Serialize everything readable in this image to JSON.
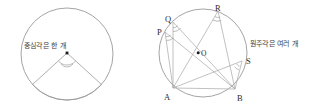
{
  "figure": {
    "background_color": "#ffffff",
    "stroke_color": "#9a9a9a",
    "label_color": "#2b2b2b",
    "width": 314,
    "height": 109
  },
  "left_panel": {
    "name": "central-angle-diagram",
    "caption": "중심각은 한 개",
    "circle": {
      "cx": 67,
      "cy": 54,
      "r": 46
    },
    "center_point": {
      "label": "",
      "x": 67,
      "y": 53
    },
    "angle_marks": 2,
    "rays": [
      {
        "from_x": 67,
        "from_y": 53,
        "to_x": 33,
        "to_y": 90
      },
      {
        "from_x": 67,
        "from_y": 53,
        "to_x": 101,
        "to_y": 90
      }
    ],
    "arc_endpoints": {
      "left_x": 33,
      "left_y": 90,
      "right_x": 101,
      "right_y": 90
    }
  },
  "right_panel": {
    "name": "inscribed-angle-diagram",
    "caption": "원주각은 여러 개",
    "circle": {
      "cx": 203,
      "cy": 53,
      "r": 44
    },
    "center_point": {
      "label": "O",
      "x": 199,
      "y": 53
    },
    "points": [
      {
        "label": "P",
        "x": 165,
        "y": 32,
        "label_x": 157,
        "label_y": 32
      },
      {
        "label": "Q",
        "x": 173,
        "y": 22,
        "label_x": 166,
        "label_y": 19
      },
      {
        "label": "R",
        "x": 218,
        "y": 11,
        "label_x": 217,
        "label_y": 8
      },
      {
        "label": "S",
        "x": 242,
        "y": 61,
        "label_x": 247,
        "label_y": 62
      },
      {
        "label": "A",
        "x": 173,
        "y": 88,
        "label_x": 166,
        "label_y": 96
      },
      {
        "label": "B",
        "x": 235,
        "y": 89,
        "label_x": 239,
        "label_y": 96
      }
    ],
    "chords": [
      {
        "from": "P",
        "to": "A"
      },
      {
        "from": "P",
        "to": "B"
      },
      {
        "from": "Q",
        "to": "A"
      },
      {
        "from": "Q",
        "to": "B"
      },
      {
        "from": "R",
        "to": "A"
      },
      {
        "from": "R",
        "to": "B"
      },
      {
        "from": "S",
        "to": "A"
      },
      {
        "from": "S",
        "to": "B"
      },
      {
        "from": "A",
        "to": "B"
      }
    ],
    "angle_vertices": [
      "P",
      "Q",
      "R",
      "S"
    ]
  }
}
